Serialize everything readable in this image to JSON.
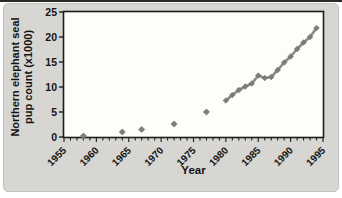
{
  "figure": {
    "background": "#d7d6d2",
    "plot_background": "#fdfdfa",
    "frame_color": "#1d1d1b",
    "tick_color": "#1d1d1b",
    "text_color": "#141414",
    "marker_color": "#7d7d7b",
    "line_color": "#8a8a88"
  },
  "chart_data": {
    "type": "scatter",
    "title": "",
    "xlabel": "Year",
    "ylabel": "Northern elephant seal\npup count (x1000)",
    "xlim": [
      1955,
      1995
    ],
    "ylim": [
      0,
      25
    ],
    "x_major_ticks": [
      1955,
      1960,
      1965,
      1970,
      1975,
      1980,
      1985,
      1990,
      1995
    ],
    "x_minor_tick_interval": 1,
    "y_ticks": [
      0,
      5,
      10,
      15,
      20,
      25
    ],
    "grid": "off",
    "legend": "none",
    "marker": "diamond",
    "series": [
      {
        "name": "early isolated pup counts",
        "connected": false,
        "points": [
          [
            1958,
            0.2
          ],
          [
            1964,
            1.0
          ],
          [
            1967,
            1.5
          ],
          [
            1972,
            2.6
          ],
          [
            1977,
            5.0
          ]
        ]
      },
      {
        "name": "annual pup counts 1980-1994",
        "connected": true,
        "points": [
          [
            1980,
            7.3
          ],
          [
            1981,
            8.4
          ],
          [
            1982,
            9.4
          ],
          [
            1983,
            10.1
          ],
          [
            1984,
            10.7
          ],
          [
            1985,
            12.3
          ],
          [
            1986,
            11.8
          ],
          [
            1987,
            12.0
          ],
          [
            1988,
            13.4
          ],
          [
            1989,
            14.9
          ],
          [
            1990,
            16.1
          ],
          [
            1991,
            17.6
          ],
          [
            1992,
            18.9
          ],
          [
            1993,
            20.0
          ],
          [
            1994,
            21.8
          ]
        ]
      }
    ]
  }
}
